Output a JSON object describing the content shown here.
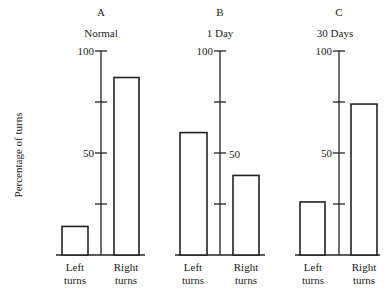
{
  "chart_data": {
    "type": "bar",
    "ylabel": "Percentage of turns",
    "ylim": [
      0,
      100
    ],
    "yticks": [
      25,
      50,
      75,
      100
    ],
    "ytick_labels_shown": [
      "50",
      "100"
    ],
    "categories": [
      "Left turns",
      "Right turns"
    ],
    "panels": [
      {
        "letter": "A",
        "title": "Normal",
        "values": [
          14,
          87
        ]
      },
      {
        "letter": "B",
        "title": "1 Day",
        "values": [
          60,
          39
        ]
      },
      {
        "letter": "C",
        "title": "30 Days",
        "values": [
          26,
          74
        ]
      }
    ],
    "grid": false,
    "legend": null
  },
  "labels": {
    "ylabel": "Percentage of turns",
    "panelA": {
      "letter": "A",
      "title": "Normal",
      "tick100": "100",
      "tick50": "50",
      "left1": "Left",
      "left2": "turns",
      "right1": "Right",
      "right2": "turns"
    },
    "panelB": {
      "letter": "B",
      "title": "1 Day",
      "tick100": "100",
      "tick50": "50",
      "left1": "Left",
      "left2": "turns",
      "right1": "Right",
      "right2": "turns"
    },
    "panelC": {
      "letter": "C",
      "title": "30 Days",
      "tick100": "100",
      "tick50": "50",
      "left1": "Left",
      "left2": "turns",
      "right1": "Right",
      "right2": "turns"
    }
  }
}
